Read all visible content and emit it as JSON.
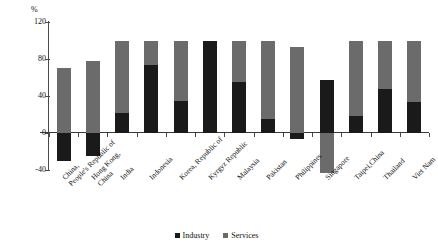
{
  "chart_data": {
    "type": "bar",
    "title": "",
    "subtitle": "",
    "xlabel": "",
    "ylabel": "",
    "unit_label": "%",
    "stacked": true,
    "grid": false,
    "legend_position": "bottom",
    "ylim": [
      -40,
      120
    ],
    "yticks": [
      120,
      80,
      40,
      0,
      -40
    ],
    "ytick_labels": [
      "120",
      "80",
      "40",
      "0",
      "-40"
    ],
    "categories": [
      "China, People's Republic of",
      "Hong Kong, China",
      "India",
      "Indonesia",
      "Korea, Republic of",
      "Kyrgyz Republic",
      "Malaysia",
      "Pakistan",
      "Philippines",
      "Singapore",
      "Taipei,China",
      "Thailand",
      "Viet Nam"
    ],
    "category_lines": [
      [
        "China,",
        "People's Republic of"
      ],
      [
        "Hong Kong,",
        "China"
      ],
      [
        "India",
        ""
      ],
      [
        "Indonesia",
        ""
      ],
      [
        "Korea, Republic of",
        ""
      ],
      [
        "Kyrgyz Republic",
        ""
      ],
      [
        "Malaysia",
        ""
      ],
      [
        "Pakistan",
        ""
      ],
      [
        "Philippines",
        ""
      ],
      [
        "Singapore",
        ""
      ],
      [
        "Taipei,China",
        ""
      ],
      [
        "Thailand",
        ""
      ],
      [
        "Viet Nam",
        ""
      ]
    ],
    "series": [
      {
        "name": "Industry",
        "color": "#1a1a1a",
        "values": [
          -30,
          -25,
          22,
          73,
          35,
          100,
          55,
          15,
          -7,
          57,
          18,
          48,
          33
        ]
      },
      {
        "name": "Services",
        "color": "#6b6b6b",
        "values": [
          70,
          78,
          78,
          27,
          65,
          0,
          45,
          85,
          93,
          -43,
          82,
          52,
          67
        ]
      }
    ]
  },
  "legend": {
    "items": [
      {
        "label": "Industry",
        "color": "#1a1a1a"
      },
      {
        "label": "Services",
        "color": "#6b6b6b"
      }
    ]
  }
}
